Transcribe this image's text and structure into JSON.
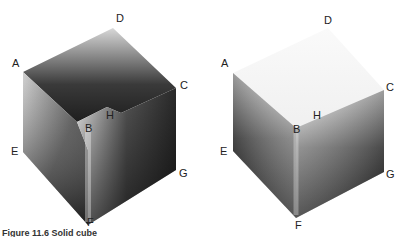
{
  "figure": {
    "caption": "Figure 11.6 Solid cube",
    "caption_note": "partially cropped at bottom edge"
  },
  "cubes": [
    {
      "id": "hollow-cube",
      "description": "open-top cube showing inner walls",
      "labels": {
        "A": "A",
        "B": "B",
        "C": "C",
        "D": "D",
        "E": "E",
        "F": "F",
        "G": "G",
        "H": "H"
      }
    },
    {
      "id": "solid-cube",
      "description": "closed solid cube",
      "labels": {
        "A": "A",
        "B": "B",
        "C": "C",
        "D": "D",
        "E": "E",
        "F": "F",
        "G": "G",
        "H": "H"
      }
    }
  ],
  "colors": {
    "dark": "#1a1a1a",
    "light": "#f4f4f4",
    "label": "#222222"
  }
}
